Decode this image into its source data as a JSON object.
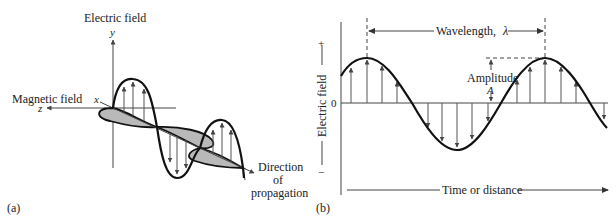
{
  "panel_a": {
    "label": "(a)",
    "electric_field_label": "Electric field",
    "magnetic_field_label": "Magnetic field",
    "axis_y": "y",
    "axis_x": "x",
    "axis_z": "z",
    "direction_label_line1": "Direction",
    "direction_label_line2": "of",
    "direction_label_line3": "propagation"
  },
  "panel_b": {
    "label": "(b)",
    "y_axis_label": "Electric field",
    "y_plus": "+",
    "y_minus": "−",
    "y_zero": "0",
    "wavelength_label": "Wavelength,",
    "wavelength_symbol": "λ",
    "amplitude_label": "Amplitude",
    "amplitude_symbol": "A",
    "x_axis_label": "Time or distance"
  },
  "colors": {
    "line": "#111111",
    "lobe_fill": "#b9b9b9",
    "background": "#ffffff"
  }
}
